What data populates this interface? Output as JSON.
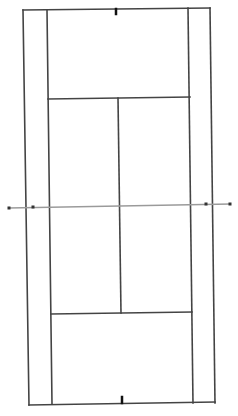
{
  "diagram": {
    "type": "tennis-court",
    "orientation": "vertical",
    "background": "#ffffff",
    "line_color": "#444444",
    "net_color": "#9a9a9a",
    "post_color": "#333333",
    "center_mark_color": "#111111",
    "elements": {
      "doubles_sideline_left": {
        "x1": 23,
        "y1": 10,
        "x2": 29,
        "y2": 405
      },
      "doubles_sideline_right": {
        "x1": 210,
        "y1": 8,
        "x2": 215,
        "y2": 403
      },
      "singles_sideline_left": {
        "x1": 47,
        "y1": 10,
        "x2": 52,
        "y2": 404
      },
      "singles_sideline_right": {
        "x1": 188,
        "y1": 8,
        "x2": 193,
        "y2": 403
      },
      "baseline_top": {
        "x1": 23,
        "y1": 10,
        "x2": 210,
        "y2": 8
      },
      "baseline_bottom": {
        "x1": 29,
        "y1": 405,
        "x2": 215,
        "y2": 402
      },
      "service_line_top": {
        "x1": 48,
        "y1": 99,
        "x2": 190,
        "y2": 97
      },
      "service_line_bottom": {
        "x1": 51,
        "y1": 314,
        "x2": 192,
        "y2": 312
      },
      "center_service_line": {
        "x1": 118,
        "y1": 98,
        "x2": 121,
        "y2": 313
      },
      "center_mark_top": {
        "x1": 116,
        "y1": 9,
        "x2": 116,
        "y2": 14
      },
      "center_mark_bottom": {
        "x1": 122,
        "y1": 397,
        "x2": 122,
        "y2": 403
      },
      "net": {
        "x1": 9,
        "y1": 208,
        "x2": 230,
        "y2": 204
      },
      "net_posts": [
        {
          "x": 9,
          "y": 208
        },
        {
          "x": 33,
          "y": 207
        },
        {
          "x": 206,
          "y": 204
        },
        {
          "x": 230,
          "y": 204
        }
      ]
    }
  }
}
